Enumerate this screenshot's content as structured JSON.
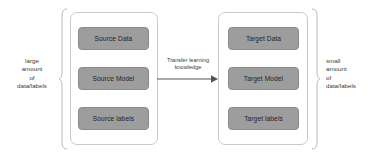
{
  "diagram": {
    "colors": {
      "node_fill": "#9d9d9d",
      "node_border": "#8a8a8a",
      "group_border": "#c9c9c9",
      "bracket": "#b9b9b9",
      "text": "#3a3a3a",
      "background": "#ffffff"
    },
    "left_annotation": "large\namount\nof\ndata/labels",
    "right_annotation": "small\namount\nof\ndata/labels",
    "arrow_label": "Transfer learning\nknowledge",
    "source_group": {
      "name": "source-domain",
      "nodes": [
        {
          "label": "Source Data"
        },
        {
          "label": "Source Model"
        },
        {
          "label": "Source labels"
        }
      ]
    },
    "target_group": {
      "name": "target-domain",
      "nodes": [
        {
          "label": "Target Data"
        },
        {
          "label": "Target Model"
        },
        {
          "label": "Target labels"
        }
      ]
    }
  }
}
